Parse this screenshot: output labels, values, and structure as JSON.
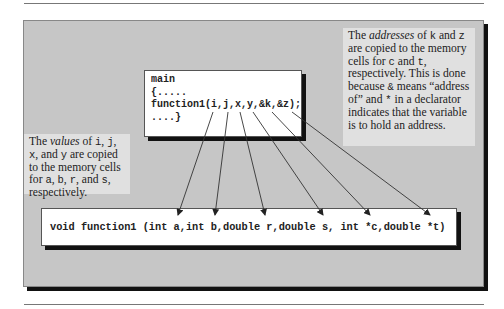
{
  "main_box": {
    "lines": [
      "main",
      "{.....",
      "function1(i,j,x,y,&k,&z);",
      "....}"
    ]
  },
  "function_box": {
    "signature": "void function1 (int a,int b,double r,double s, int *c,double *t)"
  },
  "note_right": {
    "parts": {
      "p1": "The ",
      "em1": "addresses",
      "p2": " of ",
      "v1": "k",
      "p3": " and ",
      "v2": "z",
      "p4": " are copied to the memory cells for ",
      "v3": "c",
      "p5": " and ",
      "v4": "t",
      "p6": ", respectively.  This is done because ",
      "v5": "&",
      "p7": " means “address of” and ",
      "v6": "*",
      "p8": " in a declarator indicates that the variable is to hold an address."
    }
  },
  "note_left": {
    "parts": {
      "p1": "The ",
      "em1": "values",
      "p2": " of ",
      "v1": "i",
      "p3": ", ",
      "v2": "j",
      "p4": ", ",
      "v3": "x",
      "p5": ", and ",
      "v4": "y",
      "p6": " are copied to the memory cells for ",
      "v5": "a",
      "p7": ", ",
      "v6": "b",
      "p8": ", ",
      "v7": "r",
      "p9": ", and ",
      "v8": "s",
      "p10": ", respectively."
    }
  },
  "arrows": [
    {
      "from": "i",
      "to": "a"
    },
    {
      "from": "j",
      "to": "b"
    },
    {
      "from": "x",
      "to": "r"
    },
    {
      "from": "y",
      "to": "s"
    },
    {
      "from": "&k",
      "to": "*c"
    },
    {
      "from": "&z",
      "to": "*t"
    }
  ],
  "colors": {
    "frame_bg": "#c6c6c6",
    "note_bg": "#e0e0e0",
    "shadow": "#111111",
    "arrow": "#222222"
  }
}
